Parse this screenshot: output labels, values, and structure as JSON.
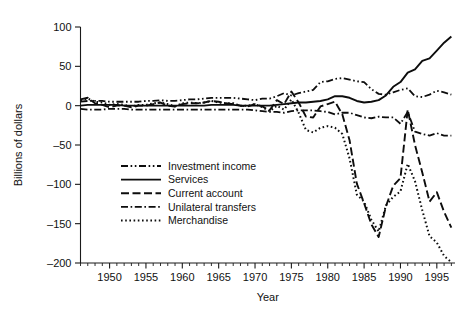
{
  "chart_data": {
    "type": "line",
    "title": "",
    "xlabel": "Year",
    "ylabel": "Billions of dollars",
    "xlim": [
      1946,
      1997.5
    ],
    "ylim": [
      -200,
      100
    ],
    "grid": false,
    "legend_position": "center-left",
    "x_ticklabels": [
      "1950",
      "1955",
      "1960",
      "1965",
      "1970",
      "1975",
      "1980",
      "1985",
      "1990",
      "1995"
    ],
    "x_tickvalues": [
      1950,
      1955,
      1960,
      1965,
      1970,
      1975,
      1980,
      1985,
      1990,
      1995
    ],
    "x_minor_step": 1,
    "y_ticklabels": [
      "100",
      "50",
      "0",
      "-50",
      "-100",
      "-150",
      "-200"
    ],
    "y_tickvalues": [
      100,
      50,
      0,
      -50,
      -100,
      -150,
      -200
    ],
    "y_minor_step": 10,
    "x": [
      1946,
      1947,
      1948,
      1949,
      1950,
      1951,
      1952,
      1953,
      1954,
      1955,
      1956,
      1957,
      1958,
      1959,
      1960,
      1961,
      1962,
      1963,
      1964,
      1965,
      1966,
      1967,
      1968,
      1969,
      1970,
      1971,
      1972,
      1973,
      1974,
      1975,
      1976,
      1977,
      1978,
      1979,
      1980,
      1981,
      1982,
      1983,
      1984,
      1985,
      1986,
      1987,
      1988,
      1989,
      1990,
      1991,
      1992,
      1993,
      1994,
      1995,
      1996,
      1997
    ],
    "series": [
      {
        "name": "Investment income",
        "linestyle": "dash-dot-dot",
        "color": "#0d0d0d",
        "values": [
          5,
          6,
          6,
          6,
          5,
          5,
          5,
          5,
          5,
          6,
          6,
          7,
          6,
          6,
          7,
          8,
          8,
          9,
          10,
          10,
          10,
          10,
          9,
          8,
          7,
          9,
          9,
          12,
          16,
          13,
          16,
          18,
          20,
          30,
          31,
          34,
          35,
          33,
          31,
          30,
          21,
          15,
          14,
          17,
          20,
          22,
          12,
          11,
          14,
          19,
          17,
          14
        ]
      },
      {
        "name": "Services",
        "linestyle": "solid",
        "color": "#0d0d0d",
        "values": [
          0,
          1,
          1,
          1,
          1,
          1,
          0,
          0,
          0,
          0,
          0,
          0,
          0,
          0,
          0,
          0,
          0,
          0,
          1,
          1,
          1,
          1,
          0,
          0,
          0,
          0,
          0,
          1,
          2,
          3,
          4,
          4,
          5,
          6,
          8,
          12,
          12,
          10,
          6,
          4,
          5,
          7,
          13,
          24,
          30,
          42,
          46,
          57,
          60,
          70,
          80,
          88
        ]
      },
      {
        "name": "Current account",
        "linestyle": "dashed",
        "color": "#0d0d0d",
        "values": [
          8,
          10,
          3,
          1,
          -2,
          0,
          0,
          -2,
          0,
          0,
          2,
          4,
          0,
          -1,
          2,
          3,
          3,
          4,
          6,
          5,
          3,
          2,
          0,
          -1,
          2,
          -1,
          -6,
          7,
          2,
          18,
          4,
          -14,
          -15,
          -1,
          2,
          5,
          -11,
          -44,
          -99,
          -124,
          -151,
          -167,
          -128,
          -102,
          -92,
          -5,
          -50,
          -85,
          -122,
          -110,
          -135,
          -155
        ]
      },
      {
        "name": "Unilateral transfers",
        "linestyle": "dash-dot",
        "color": "#0d0d0d",
        "values": [
          -4,
          -5,
          -5,
          -5,
          -4,
          -4,
          -4,
          -5,
          -5,
          -5,
          -5,
          -5,
          -5,
          -5,
          -5,
          -5,
          -5,
          -5,
          -5,
          -5,
          -5,
          -5,
          -5,
          -5,
          -6,
          -7,
          -8,
          -8,
          -9,
          -7,
          -6,
          -6,
          -6,
          -7,
          -8,
          -11,
          -9,
          -9,
          -12,
          -15,
          -16,
          -14,
          -15,
          -15,
          -23,
          -8,
          -33,
          -36,
          -38,
          -35,
          -38,
          -38
        ]
      },
      {
        "name": "Merchandise",
        "linestyle": "dotted",
        "color": "#0d0d0d",
        "values": [
          7,
          9,
          5,
          4,
          1,
          2,
          1,
          -1,
          1,
          1,
          3,
          4,
          2,
          -1,
          3,
          4,
          3,
          4,
          6,
          4,
          3,
          3,
          0,
          0,
          2,
          -2,
          -7,
          0,
          -5,
          8,
          -9,
          -31,
          -34,
          -28,
          -26,
          -28,
          -36,
          -67,
          -113,
          -122,
          -145,
          -160,
          -127,
          -116,
          -109,
          -74,
          -96,
          -133,
          -166,
          -174,
          -191,
          -199
        ]
      }
    ]
  },
  "legend": {
    "items": [
      {
        "label": "Investment income"
      },
      {
        "label": "Services"
      },
      {
        "label": "Current account"
      },
      {
        "label": "Unilateral transfers"
      },
      {
        "label": "Merchandise"
      }
    ]
  }
}
